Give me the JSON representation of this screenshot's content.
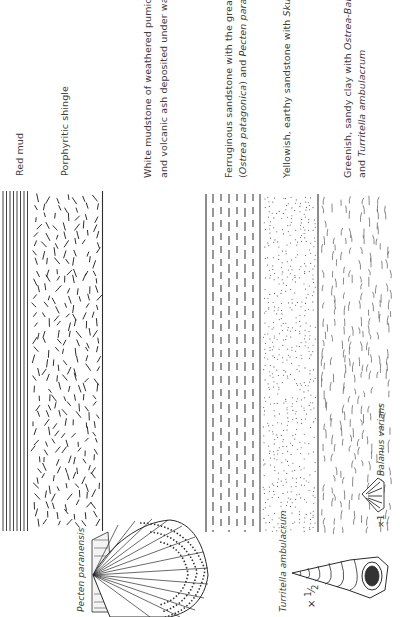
{
  "figure": {
    "orientation": "rotated -90deg (read bottom-to-top)",
    "strata": [
      {
        "id": "red-mud",
        "label": "Red mud",
        "pattern": "vertical-lines"
      },
      {
        "id": "porphyritic-shingle",
        "label": "Porphyritic shingle",
        "pattern": "scattered-dashes"
      },
      {
        "id": "white-mudstone",
        "label_line1": "White mudstone of weathered pumice",
        "label_line2": "and volcanic ash deposited under water",
        "pattern": "blank"
      },
      {
        "id": "ferruginous-sandstone",
        "label_line1": "Ferruginous sandstone with the great oyster",
        "label_line2_pre": "(",
        "label_line2_italic1": "Ostrea patagonica",
        "label_line2_mid": ") and ",
        "label_line2_italic2": "Pecten paranensis",
        "pattern": "dashed-lines"
      },
      {
        "id": "yellowish-sandstone",
        "label_pre": "Yellowish, earthy sandstone with ",
        "label_italic": "Skutella",
        "pattern": "dots"
      },
      {
        "id": "greenish-sandy-clay",
        "label_line1_pre": "Greenish, sandy clay with ",
        "label_line1_italic": "Ostrea",
        "label_line1_mid": "-",
        "label_line1_italic2": "Balanus varians",
        "label_line2_pre": "and ",
        "label_line2_italic": "Turritella ambulacrum",
        "pattern": "scattered-curves"
      }
    ],
    "fossils": [
      {
        "id": "pecten",
        "label": "Pecten paranensis"
      },
      {
        "id": "turritella",
        "label": "Turritella ambulacrum",
        "scale_prefix": "×",
        "scale_num": "1",
        "scale_den": "2"
      },
      {
        "id": "balanus",
        "label": "Balanus varians",
        "scale": "×1"
      }
    ],
    "colors": {
      "ink": "#2e2e2e",
      "paper": "#ffffff",
      "text": "#3c3c3c"
    }
  }
}
